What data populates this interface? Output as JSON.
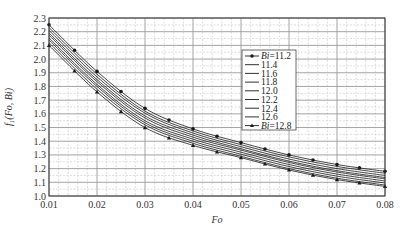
{
  "chart_data": {
    "type": "line",
    "title": "",
    "xlabel": "Fo",
    "ylabel": "f1(Fo, Bi)",
    "xlim": [
      0.01,
      0.08
    ],
    "ylim": [
      1.0,
      2.3
    ],
    "grid": true,
    "legend_position": "upper-right-inside",
    "x_ticks": [
      "0.01",
      "0.02",
      "0.03",
      "0.04",
      "0.05",
      "0.06",
      "0.07",
      "0.08"
    ],
    "y_ticks": [
      "1.0",
      "1.1",
      "1.2",
      "1.3",
      "1.4",
      "1.5",
      "1.6",
      "1.7",
      "1.8",
      "1.9",
      "2.0",
      "2.1",
      "2.2",
      "2.3"
    ],
    "x": [
      0.01,
      0.02,
      0.03,
      0.04,
      0.05,
      0.06,
      0.07,
      0.08
    ],
    "series": [
      {
        "name": "Bi=11.2",
        "marker": "circle",
        "values": [
          2.25,
          1.91,
          1.64,
          1.49,
          1.39,
          1.3,
          1.23,
          1.18
        ]
      },
      {
        "name": "11.4",
        "marker": "none",
        "values": [
          2.23,
          1.89,
          1.62,
          1.475,
          1.375,
          1.286,
          1.216,
          1.166
        ]
      },
      {
        "name": "11.6",
        "marker": "none",
        "values": [
          2.21,
          1.87,
          1.605,
          1.46,
          1.36,
          1.27,
          1.2,
          1.15
        ]
      },
      {
        "name": "11.8",
        "marker": "none",
        "values": [
          2.19,
          1.85,
          1.585,
          1.445,
          1.345,
          1.255,
          1.185,
          1.135
        ]
      },
      {
        "name": "12.0",
        "marker": "none",
        "values": [
          2.175,
          1.835,
          1.57,
          1.43,
          1.335,
          1.245,
          1.175,
          1.125
        ]
      },
      {
        "name": "12.2",
        "marker": "none",
        "values": [
          2.155,
          1.815,
          1.55,
          1.415,
          1.32,
          1.23,
          1.16,
          1.11
        ]
      },
      {
        "name": "12.4",
        "marker": "none",
        "values": [
          2.14,
          1.8,
          1.535,
          1.4,
          1.305,
          1.215,
          1.145,
          1.095
        ]
      },
      {
        "name": "12.6",
        "marker": "none",
        "values": [
          2.12,
          1.78,
          1.52,
          1.385,
          1.29,
          1.2,
          1.13,
          1.08
        ]
      },
      {
        "name": "Bi=12.8",
        "marker": "triangle",
        "values": [
          2.1,
          1.76,
          1.5,
          1.37,
          1.28,
          1.19,
          1.12,
          1.07
        ]
      }
    ],
    "legend": [
      {
        "label_prefix": "Bi",
        "label_value": "=11.2",
        "marker": "circle"
      },
      {
        "label_prefix": "",
        "label_value": "11.4",
        "marker": "none"
      },
      {
        "label_prefix": "",
        "label_value": "11.6",
        "marker": "none"
      },
      {
        "label_prefix": "",
        "label_value": "11.8",
        "marker": "none"
      },
      {
        "label_prefix": "",
        "label_value": "12.0",
        "marker": "none"
      },
      {
        "label_prefix": "",
        "label_value": "12.2",
        "marker": "none"
      },
      {
        "label_prefix": "",
        "label_value": "12.4",
        "marker": "none"
      },
      {
        "label_prefix": "",
        "label_value": "12.6",
        "marker": "none"
      },
      {
        "label_prefix": "Bi",
        "label_value": "=12.8",
        "marker": "triangle"
      }
    ]
  },
  "colors": {
    "line": "#1a1a1a",
    "grid_major": "#9a9a9a",
    "grid_minor": "#c8c8c8",
    "axis": "#333333"
  }
}
